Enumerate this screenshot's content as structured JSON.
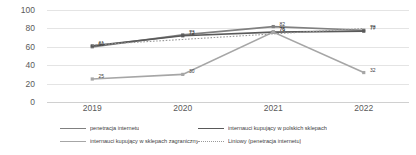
{
  "chart_data": {
    "type": "line",
    "title": "",
    "subtitle": "",
    "xlabel": "",
    "ylabel": "",
    "categories": [
      "2019",
      "2020",
      "2021",
      "2022"
    ],
    "ylim": [
      0,
      100
    ],
    "yticks": [
      "0",
      "20",
      "40",
      "60",
      "80",
      "100"
    ],
    "grid": true,
    "legend_position": "bottom",
    "series": [
      {
        "name": "penetracja internetu",
        "color": "#808080",
        "style": "solid",
        "values": [
          60,
          73,
          82,
          78
        ],
        "labels": [
          "60",
          "73",
          "82",
          "78"
        ]
      },
      {
        "name": "internauci kupujący w polskich sklepach",
        "color": "#595959",
        "style": "solid",
        "values": [
          61,
          72,
          76,
          77
        ],
        "labels": [
          "61",
          "72",
          "76",
          "77"
        ]
      },
      {
        "name": "internauci kupujący w sklepach zagranicznych",
        "color": "#a6a6a6",
        "style": "solid",
        "values": [
          25,
          30,
          76,
          32
        ],
        "labels": [
          "25",
          "30",
          "76",
          "32"
        ]
      },
      {
        "name": "Liniowy (penetracja internetu)",
        "color": "#9a9a9a",
        "style": "dotted",
        "values": [
          62,
          68,
          74,
          80
        ],
        "labels": []
      }
    ]
  },
  "legend": {
    "items": [
      {
        "label": "penetracja internetu",
        "color": "#808080",
        "style": "solid"
      },
      {
        "label": "internauci kupujący w polskich sklepach",
        "color": "#595959",
        "style": "solid"
      },
      {
        "label": "internauci kupujący w sklepach zagranicznych",
        "color": "#a6a6a6",
        "style": "solid"
      },
      {
        "label": "Liniowy (penetracja internetu)",
        "color": "#9a9a9a",
        "style": "dotted"
      }
    ]
  }
}
